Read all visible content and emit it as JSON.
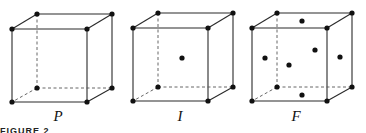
{
  "figure": {
    "caption": "FIGURE 2",
    "cubes": [
      {
        "label": "P",
        "name": "primitive",
        "label_pos": [
          58,
          110
        ],
        "offset": [
          0,
          0
        ],
        "extra_points": []
      },
      {
        "label": "I",
        "name": "body-centered",
        "label_pos": [
          180,
          110
        ],
        "offset": [
          121,
          -1
        ],
        "extra_points": [
          [
            182,
            58
          ]
        ]
      },
      {
        "label": "F",
        "name": "face-centered",
        "label_pos": [
          296,
          110
        ],
        "offset": [
          240,
          -1
        ],
        "extra_points": [
          [
            302,
            21
          ],
          [
            265,
            58
          ],
          [
            289,
            65
          ],
          [
            315,
            50
          ],
          [
            340,
            57
          ],
          [
            302,
            95
          ]
        ]
      }
    ]
  }
}
